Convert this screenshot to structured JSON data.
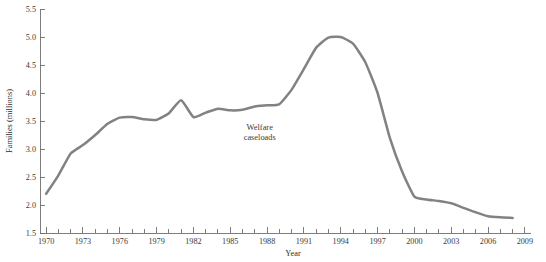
{
  "figure": {
    "background_color": "#ffffff",
    "width": 546,
    "height": 262
  },
  "chart_data": {
    "type": "line",
    "title": "",
    "subtitle": "",
    "xlabel": "Year",
    "ylabel": "Families (millions)",
    "xlim": [
      1969.5,
      2009.5
    ],
    "ylim": [
      1.5,
      5.5
    ],
    "grid": false,
    "legend_position": "none",
    "series": [
      {
        "name": "Welfare caseloads",
        "color": "#828282",
        "line_width": 2.5,
        "x": [
          1970,
          1971,
          1972,
          1973,
          1974,
          1975,
          1976,
          1977,
          1978,
          1979,
          1980,
          1981,
          1982,
          1983,
          1984,
          1985,
          1986,
          1987,
          1988,
          1989,
          1990,
          1991,
          1992,
          1993,
          1994,
          1995,
          1996,
          1997,
          1998,
          1999,
          2000,
          2001,
          2002,
          2003,
          2004,
          2005,
          2006,
          2007,
          2008
        ],
        "values": [
          2.2,
          2.53,
          2.92,
          3.07,
          3.25,
          3.45,
          3.56,
          3.57,
          3.53,
          3.52,
          3.64,
          3.87,
          3.57,
          3.65,
          3.72,
          3.69,
          3.7,
          3.76,
          3.78,
          3.8,
          4.06,
          4.43,
          4.81,
          4.99,
          5.0,
          4.88,
          4.55,
          4.0,
          3.2,
          2.6,
          2.15,
          2.1,
          2.07,
          2.03,
          1.95,
          1.87,
          1.8,
          1.78,
          1.77
        ]
      }
    ],
    "x_major_ticks": [
      1970,
      1973,
      1976,
      1979,
      1982,
      1985,
      1988,
      1991,
      1994,
      1997,
      2000,
      2003,
      2006,
      2009
    ],
    "x_major_tick_labels": [
      "1970",
      "1973",
      "1976",
      "1979",
      "1982",
      "1985",
      "1988",
      "1991",
      "1994",
      "1997",
      "2000",
      "2003",
      "2006",
      "2009"
    ],
    "x_minor_tick_interval": 1,
    "y_ticks": [
      1.5,
      2.0,
      2.5,
      3.0,
      3.5,
      4.0,
      4.5,
      5.0,
      5.5
    ],
    "y_tick_labels": [
      "1.5",
      "2.0",
      "2.5",
      "3.0",
      "3.5",
      "4.0",
      "4.5",
      "5.0",
      "5.5"
    ],
    "annotations": [
      {
        "name": "welfare-caseloads-label",
        "lines": [
          "Welfare",
          "caseloads"
        ],
        "x": 1987.4,
        "y": 3.34
      }
    ]
  },
  "colors": {
    "series_gray": "#828282",
    "axis_gray": "#6f6f6f",
    "text_dark": "#2e2e2e"
  }
}
